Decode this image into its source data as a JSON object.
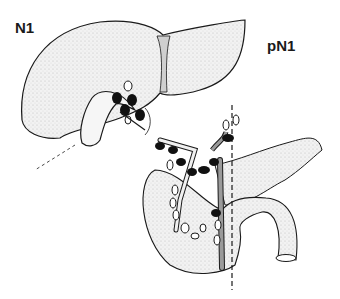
{
  "labels": {
    "left": "N1",
    "right": "pN1"
  },
  "colors": {
    "outline": "#1a1a1a",
    "organ_fill": "#ececec",
    "node_filled": "#111111",
    "node_open": "#ffffff",
    "vessel_fill": "#9a9a9a"
  }
}
